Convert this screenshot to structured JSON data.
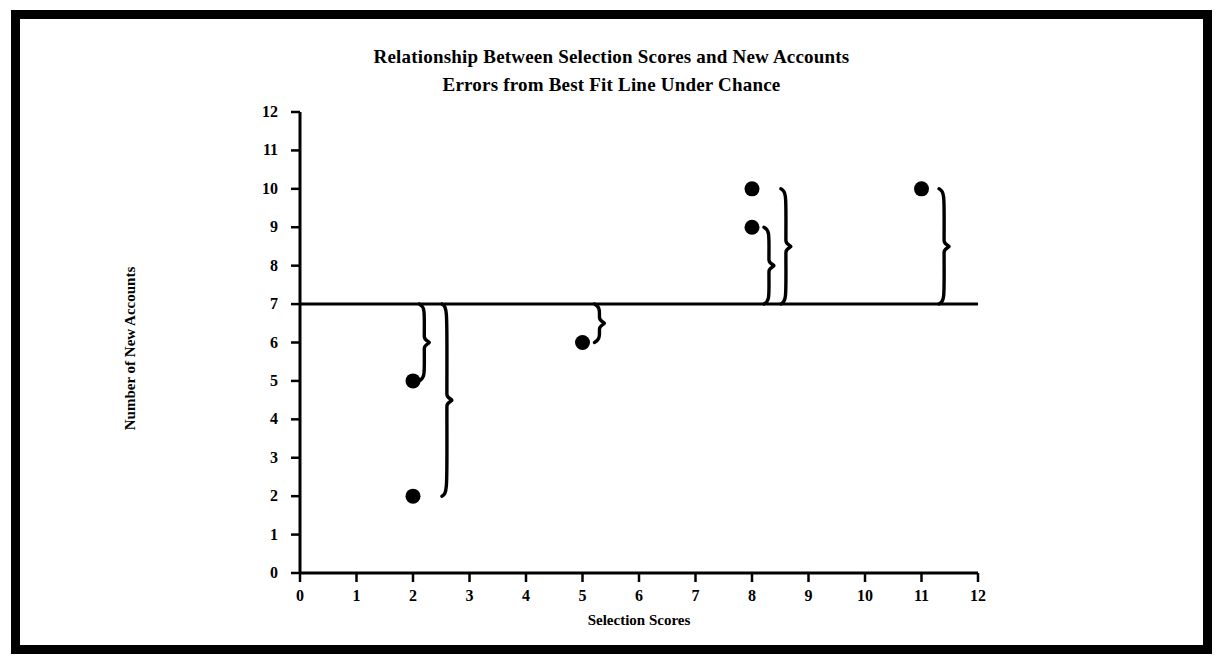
{
  "chart_data": {
    "type": "scatter",
    "title": "Relationship Between Selection Scores and New Accounts Errors from Best Fit Line Under Chance",
    "title_line_1": "Relationship Between Selection Scores and New Accounts",
    "title_line_2": "Errors from Best Fit Line Under Chance",
    "xlabel": "Selection Scores",
    "ylabel": "Number of New Accounts",
    "xlim": [
      0,
      12
    ],
    "ylim": [
      0,
      12
    ],
    "xticks": [
      0,
      1,
      2,
      3,
      4,
      5,
      6,
      7,
      8,
      9,
      10,
      11,
      12
    ],
    "yticks": [
      0,
      1,
      2,
      3,
      4,
      5,
      6,
      7,
      8,
      9,
      10,
      11,
      12
    ],
    "xtick_labels": [
      "0",
      "1",
      "2",
      "3",
      "4",
      "5",
      "6",
      "7",
      "8",
      "9",
      "10",
      "11",
      "12"
    ],
    "ytick_labels": [
      "0",
      "1",
      "2",
      "3",
      "4",
      "5",
      "6",
      "7",
      "8",
      "9",
      "10",
      "11",
      "12"
    ],
    "grid": false,
    "legend": false,
    "marker": "filled-circle",
    "marker_color": "#000000",
    "points": [
      {
        "x": 2,
        "y": 5
      },
      {
        "x": 2,
        "y": 2
      },
      {
        "x": 5,
        "y": 6
      },
      {
        "x": 8,
        "y": 10
      },
      {
        "x": 8,
        "y": 9
      },
      {
        "x": 11,
        "y": 10
      }
    ],
    "reference_line": {
      "type": "horizontal",
      "y": 7,
      "label": "Best Fit Line Under Chance",
      "color": "#000000"
    },
    "error_braces": [
      {
        "x": 2.2,
        "from_y": 7,
        "to_y": 5,
        "error": -2
      },
      {
        "x": 2.6,
        "from_y": 7,
        "to_y": 2,
        "error": -5
      },
      {
        "x": 5.3,
        "from_y": 7,
        "to_y": 6,
        "error": -1
      },
      {
        "x": 8.3,
        "from_y": 7,
        "to_y": 9,
        "error": 2
      },
      {
        "x": 8.6,
        "from_y": 7,
        "to_y": 10,
        "error": 3
      },
      {
        "x": 11.4,
        "from_y": 7,
        "to_y": 10,
        "error": 3
      }
    ]
  },
  "axis": {
    "x_title": "Selection Scores",
    "y_title": "Number of New Accounts"
  },
  "title": {
    "line1": "Relationship Between Selection Scores and New Accounts",
    "line2": "Errors from Best Fit Line Under Chance"
  }
}
